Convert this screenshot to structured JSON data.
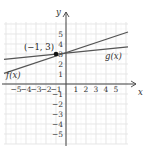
{
  "chart_data": {
    "type": "line",
    "title": "",
    "xlabel": "x",
    "ylabel": "y",
    "xlim": [
      -6.2,
      6.2
    ],
    "ylim": [
      -6,
      6
    ],
    "grid": true,
    "x_ticks": [
      "−5",
      "−4",
      "−3",
      "−2",
      "−1",
      "1",
      "2",
      "3",
      "4",
      "5"
    ],
    "y_ticks": [
      "−5",
      "−4",
      "−3",
      "−2",
      "−1",
      "1",
      "2",
      "3",
      "4",
      "5"
    ],
    "series": [
      {
        "name": "f(x)",
        "x": [
          -6.2,
          6.2
        ],
        "y": [
          1.07,
          5.2
        ]
      },
      {
        "name": "g(x)",
        "x": [
          -6.2,
          6.2
        ],
        "y": [
          2.47,
          3.72
        ]
      }
    ],
    "annotations": [
      {
        "text": "(−1, 3)",
        "x": -1,
        "y": 3,
        "marker": "point"
      }
    ],
    "legend": "inline labels"
  },
  "labels": {
    "x_axis": "x",
    "y_axis": "y",
    "f": "f(x)",
    "g": "g(x)",
    "point": "(−1, 3)"
  },
  "colors": {
    "grid": "#d9d9d9",
    "axis": "#444444",
    "line": "#555555",
    "point": "#111111"
  }
}
